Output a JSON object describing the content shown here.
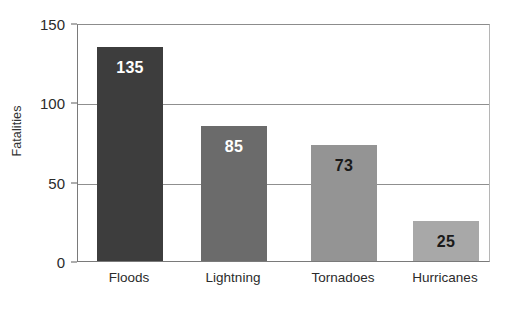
{
  "chart_data": {
    "type": "bar",
    "title": "",
    "subtitle": "",
    "xlabel": "",
    "ylabel": "Fatalities",
    "categories": [
      "Floods",
      "Lightning",
      "Tornadoes",
      "Hurricanes"
    ],
    "values": [
      135,
      85,
      73,
      25
    ],
    "value_labels": [
      "135",
      "85",
      "73",
      "25"
    ],
    "bar_colors": [
      "#3d3d3d",
      "#6b6b6b",
      "#949494",
      "#a8a8a8"
    ],
    "value_label_colors": [
      "#ffffff",
      "#ffffff",
      "#1a1a1a",
      "#1a1a1a"
    ],
    "ylim": [
      0,
      150
    ],
    "yticks": [
      0,
      50,
      100,
      150
    ],
    "ytick_labels": [
      "0",
      "50",
      "100",
      "150"
    ],
    "grid": true,
    "grid_axis": "y",
    "legend": false,
    "legend_position": "none",
    "axis_color": "#8c8c8c",
    "gridline_color": "#8f8f8f",
    "background_color": "#ffffff"
  }
}
